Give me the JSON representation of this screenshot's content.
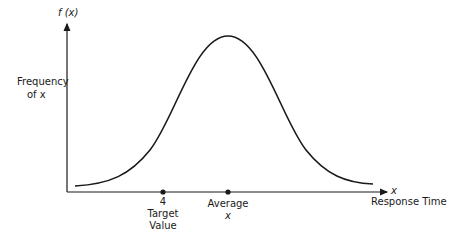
{
  "diagram": {
    "y_axis_label": "f (x)",
    "y_axis_desc_line1": "Frequency",
    "y_axis_desc_line2": "of  x",
    "x_axis_label": "x",
    "x_axis_desc": "Response Time",
    "markers": [
      {
        "name": "target",
        "line1": "4",
        "line2": "Target",
        "line3": "Value"
      },
      {
        "name": "average",
        "line1": "Average",
        "line2": "x"
      }
    ],
    "curve": "bell-shaped normal distribution",
    "colors": {
      "line": "#1a1a1a",
      "background": "#ffffff"
    }
  }
}
